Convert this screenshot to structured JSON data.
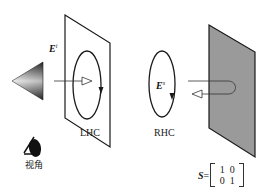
{
  "diagram": {
    "type": "polarization-scattering",
    "incident_field": {
      "symbol": "E",
      "superscript": "i"
    },
    "scattered_field": {
      "symbol": "E",
      "superscript": "s"
    },
    "left_plane_label": "LHC",
    "right_plane_label": "RHC",
    "viewpoint_label": "视角",
    "scattering_matrix": {
      "symbol": "S",
      "equals": "=",
      "rows": [
        [
          "1",
          "0"
        ],
        [
          "0",
          "1"
        ]
      ]
    },
    "colors": {
      "line": "#1a1a1a",
      "reflector_fill": "#9a9a9a",
      "cone_dark": "#2a2a2a",
      "cone_light": "#e8e8e8"
    }
  }
}
